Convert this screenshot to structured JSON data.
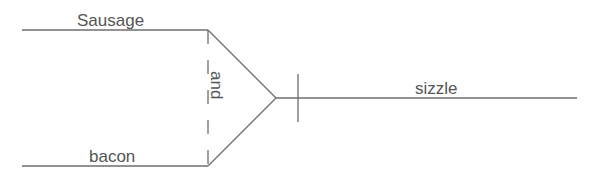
{
  "diagram": {
    "type": "sentence-diagram",
    "subject": {
      "words": [
        "Sausage",
        "bacon"
      ],
      "conjunction": "and"
    },
    "predicate": "sizzle",
    "colors": {
      "line": "#6e6e6e",
      "text": "#555555",
      "background": "#ffffff"
    }
  }
}
